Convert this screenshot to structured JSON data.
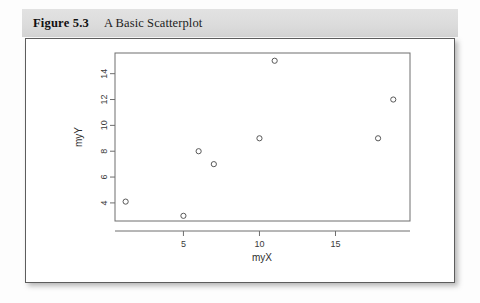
{
  "caption": {
    "figure_number": "Figure 5.3",
    "title": "A Basic Scatterplot"
  },
  "chart_data": {
    "type": "scatter",
    "title": "",
    "xlabel": "myX",
    "ylabel": "myY",
    "xlim": [
      0.5,
      19.9
    ],
    "ylim": [
      2.6,
      15.6
    ],
    "xticks": [
      5,
      10,
      15
    ],
    "yticks": [
      4,
      6,
      8,
      10,
      12,
      14
    ],
    "xtick_labels": [
      "5",
      "10",
      "15"
    ],
    "ytick_labels": [
      "4",
      "6",
      "8",
      "10",
      "12",
      "14"
    ],
    "grid": false,
    "legend": false,
    "marker": "open-circle",
    "marker_color": "#585858",
    "points": [
      {
        "x": 1.2,
        "y": 4.1
      },
      {
        "x": 5.0,
        "y": 3.0
      },
      {
        "x": 6.0,
        "y": 8.0
      },
      {
        "x": 7.0,
        "y": 7.0
      },
      {
        "x": 10.0,
        "y": 9.0
      },
      {
        "x": 11.0,
        "y": 15.0
      },
      {
        "x": 17.8,
        "y": 9.0
      },
      {
        "x": 18.8,
        "y": 12.0
      }
    ]
  },
  "colors": {
    "band": "#dcdcdc",
    "card_border": "#5d5d5d",
    "axis": "#6e6e6e"
  }
}
